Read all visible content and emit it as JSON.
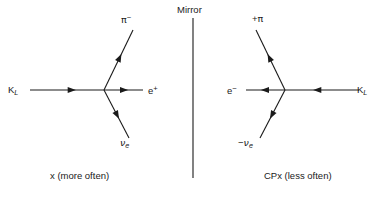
{
  "figure": {
    "background_color": "#ffffff",
    "ink_color": "#1a1a1a",
    "mirror": {
      "label": "Mirror",
      "axis_x": 193,
      "axis_y_top": 18,
      "axis_y_bottom": 178
    },
    "panels": [
      {
        "id": "left",
        "caption_prefix": "x",
        "caption_suffix": " (more often)",
        "vertex": {
          "x": 104,
          "y": 90
        },
        "particles": [
          {
            "name": "incoming-kaon",
            "symbol_main": "K",
            "symbol_sub": "L",
            "symbol_sup": "",
            "label_x": 8,
            "label_y": 85,
            "direction": "right",
            "line": {
              "x1": 30,
              "y1": 90,
              "x2": 104,
              "y2": 90
            },
            "arrow_t": 0.62
          },
          {
            "name": "outgoing-pion",
            "symbol_main": "π",
            "symbol_sub": "",
            "symbol_sup": "−",
            "label_x": 121,
            "label_y": 14,
            "direction": "up-right",
            "line": {
              "x1": 104,
              "y1": 90,
              "x2": 133,
              "y2": 30
            },
            "arrow_t": 0.6
          },
          {
            "name": "outgoing-positron",
            "symbol_main": "e",
            "symbol_sub": "",
            "symbol_sup": "+",
            "label_x": 148,
            "label_y": 85,
            "direction": "right",
            "line": {
              "x1": 104,
              "y1": 90,
              "x2": 143,
              "y2": 90
            },
            "arrow_t": 0.62
          },
          {
            "name": "outgoing-neutrino",
            "symbol_main": "ν",
            "symbol_sub": "e",
            "symbol_sup": "",
            "label_x": 120,
            "label_y": 138,
            "direction": "down-right",
            "line": {
              "x1": 104,
              "y1": 90,
              "x2": 129,
              "y2": 138
            },
            "arrow_t": 0.6
          }
        ]
      },
      {
        "id": "right",
        "caption_prefix": "CP",
        "caption_italic": "x",
        "caption_suffix": " (less often)",
        "vertex": {
          "x": 285,
          "y": 90
        },
        "particles": [
          {
            "name": "incoming-kaon",
            "symbol_main": "K",
            "symbol_sub": "L",
            "symbol_sup": "",
            "label_x": 357,
            "label_y": 85,
            "direction": "left",
            "line": {
              "x1": 359,
              "y1": 90,
              "x2": 285,
              "y2": 90
            },
            "arrow_t": 0.62
          },
          {
            "name": "outgoing-pion",
            "symbol_main": "π",
            "symbol_sub": "",
            "symbol_sup": "",
            "prefix": "+",
            "label_x": 252,
            "label_y": 14,
            "direction": "up-left",
            "line": {
              "x1": 285,
              "y1": 90,
              "x2": 256,
              "y2": 30
            },
            "arrow_t": 0.6
          },
          {
            "name": "outgoing-electron",
            "symbol_main": "e",
            "symbol_sub": "",
            "symbol_sup": "−",
            "label_x": 227,
            "label_y": 85,
            "direction": "left",
            "line": {
              "x1": 285,
              "y1": 90,
              "x2": 246,
              "y2": 90
            },
            "arrow_t": 0.62
          },
          {
            "name": "outgoing-antineutrino",
            "symbol_main": "ν",
            "symbol_sub": "e",
            "symbol_sup": "",
            "prefix": "−",
            "label_x": 238,
            "label_y": 138,
            "direction": "down-left",
            "line": {
              "x1": 285,
              "y1": 90,
              "x2": 260,
              "y2": 138
            },
            "arrow_t": 0.6
          }
        ]
      }
    ]
  }
}
